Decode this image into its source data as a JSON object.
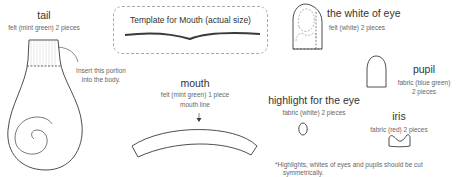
{
  "pieces": {
    "tail": {
      "title": "tail",
      "material": "felt (mint green) 2 pieces",
      "note_line1": "Insert this portion",
      "note_line2": "into the body."
    },
    "template": {
      "title": "Template for Mouth (actual size)"
    },
    "mouth": {
      "title": "mouth",
      "material": "felt (mint green) 1 piece",
      "label": "mouth line"
    },
    "white_of_eye": {
      "title": "the white of eye",
      "material": "felt (white) 2 pieces"
    },
    "pupil": {
      "title": "pupil",
      "material_line1": "fabric (blue green)",
      "material_line2": "2 pieces"
    },
    "highlight": {
      "title": "highlight for the eye",
      "material": "fabric (white) 2 pieces"
    },
    "iris": {
      "title": "iris",
      "material": "fabric (red) 2 pieces"
    }
  },
  "footnote": {
    "line1": "*Highlights, whites of eyes and pupils should be cut",
    "line2": "symmetrically."
  },
  "colors": {
    "outline": "#3a3a3a",
    "dashed": "#888888",
    "text": "#333333",
    "subtext": "#666666"
  }
}
